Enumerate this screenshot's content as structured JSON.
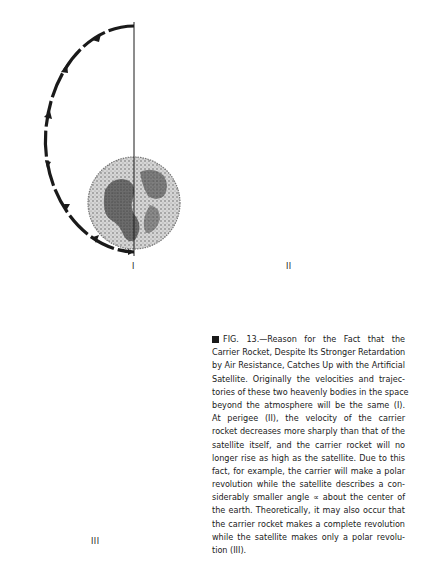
{
  "figure": {
    "number": "13",
    "panels": [
      {
        "id": "I",
        "label": "I",
        "description": "Carrier rocket and satellite on the same trajectory"
      },
      {
        "id": "II",
        "label": "II",
        "description": "At perigee the carrier rocket's velocity decreases more sharply; it no longer rises as high as the satellite"
      },
      {
        "id": "III",
        "label": "III",
        "description": "Carrier rocket makes a complete revolution while the satellite makes only a polar revolution"
      }
    ]
  },
  "caption": {
    "lines": [
      "FIG. 13.—Reason for the Fact that the",
      "Carrier Rocket, Despite Its Stronger Retardation",
      "by Air Resistance, Catches Up with the Artificial",
      "Satellite. Originally the velocities and trajec-",
      "tories of these two heavenly bodies in the space",
      "beyond the atmosphere will be the same (I).",
      "At perigee (II), the velocity of the carrier",
      "rocket decreases more sharply than that of the",
      "satellite itself, and the carrier rocket will no",
      "longer rise as high as the satellite. Due to this",
      "fact, for example, the carrier will make a polar",
      "revolution while the satellite describes a con-",
      "siderably smaller angle ∝ about the center of",
      "the earth. Theoretically, it may also occur that",
      "the carrier rocket makes a complete revolution",
      "while the satellite makes only a polar revolu-",
      "tion (III)."
    ]
  },
  "colors": {
    "ink": "#1a1a1a",
    "paper": "#ffffff",
    "earth_dark": "#3a3a3a",
    "earth_light": "#bdbdbd"
  }
}
